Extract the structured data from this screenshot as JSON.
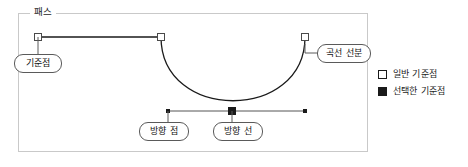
{
  "group": {
    "title": "패스"
  },
  "callouts": {
    "anchor_point": "기준점",
    "curve_segment": "곡선 선분",
    "direction_point": "방향 점",
    "direction_line": "방향 선"
  },
  "legend": {
    "items": [
      {
        "label": "일반 기준점",
        "swatch": "hollow-square-icon",
        "color": "#ffffff"
      },
      {
        "label": "선택한 기준점",
        "swatch": "filled-square-icon",
        "color": "#1a1a1a"
      }
    ]
  },
  "colors": {
    "frame_border": "#c9c9c9",
    "path_stroke": "#1a1a1a",
    "direction_line": "#555555",
    "callout_border": "#5a5a5a",
    "text": "#1c1c1c",
    "background": "#ffffff"
  },
  "diagram": {
    "type": "bezier-path-illustration",
    "anchor_points": [
      {
        "name": "left-anchor",
        "x": 38,
        "y": 37,
        "state": "normal"
      },
      {
        "name": "mid-anchor",
        "x": 161,
        "y": 37,
        "state": "normal"
      },
      {
        "name": "right-anchor",
        "x": 305,
        "y": 37,
        "state": "normal"
      },
      {
        "name": "selected-anchor",
        "x": 232,
        "y": 111,
        "state": "selected"
      }
    ],
    "direction_points": [
      {
        "name": "left-direction-point",
        "x": 168,
        "y": 111
      },
      {
        "name": "right-direction-point",
        "x": 305,
        "y": 111
      }
    ],
    "segments": [
      {
        "name": "straight-segment",
        "from": [
          38,
          37
        ],
        "to": [
          161,
          37
        ],
        "kind": "line"
      },
      {
        "name": "curve-segment",
        "from": [
          161,
          37
        ],
        "to": [
          305,
          37
        ],
        "kind": "cubic-bezier",
        "c1": [
          161,
          120
        ],
        "c2": [
          305,
          120
        ]
      }
    ],
    "direction_line": {
      "from": [
        168,
        111
      ],
      "to": [
        305,
        111
      ]
    }
  }
}
